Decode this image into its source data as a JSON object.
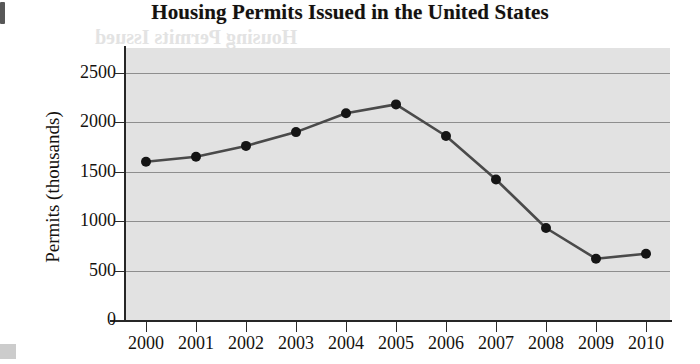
{
  "page": {
    "title": "Housing Permits Issued in the United States",
    "page_marker": "",
    "background_color": "#ffffff",
    "plot_background_color": "#e2e2e2",
    "line_color": "#4a4a4a",
    "marker_color": "#151515",
    "gridline_color": "#8e8e8e",
    "axis_color": "#262626",
    "ghost_text_top": "Housing Permits Issued",
    "ghost_text_mid": "that of the",
    "ghost_text_low": "housing"
  },
  "chart_data": {
    "type": "line",
    "title": "Housing Permits Issued in the United States",
    "xlabel": "",
    "ylabel": "Permits (thousands)",
    "categories": [
      "2000",
      "2001",
      "2002",
      "2003",
      "2004",
      "2005",
      "2006",
      "2007",
      "2008",
      "2009",
      "2010"
    ],
    "values": [
      1600,
      1650,
      1760,
      1900,
      2090,
      2180,
      1860,
      1420,
      930,
      620,
      670
    ],
    "series": [
      {
        "name": "Housing permits issued",
        "values": [
          1600,
          1650,
          1760,
          1900,
          2090,
          2180,
          1860,
          1420,
          930,
          620,
          670
        ]
      }
    ],
    "ylim": [
      0,
      2750
    ],
    "yticks": [
      0,
      500,
      1000,
      1500,
      2000,
      2500
    ],
    "ytick_labels": [
      "0",
      "500",
      "1000",
      "1500",
      "2000",
      "2500"
    ],
    "xtick_labels": [
      "2000",
      "2001",
      "2002",
      "2003",
      "2004",
      "2005",
      "2006",
      "2007",
      "2008",
      "2009",
      "2010"
    ],
    "grid": true,
    "grid_axis": "y",
    "legend": false,
    "legend_position": "none",
    "markers": "filled-circle"
  }
}
